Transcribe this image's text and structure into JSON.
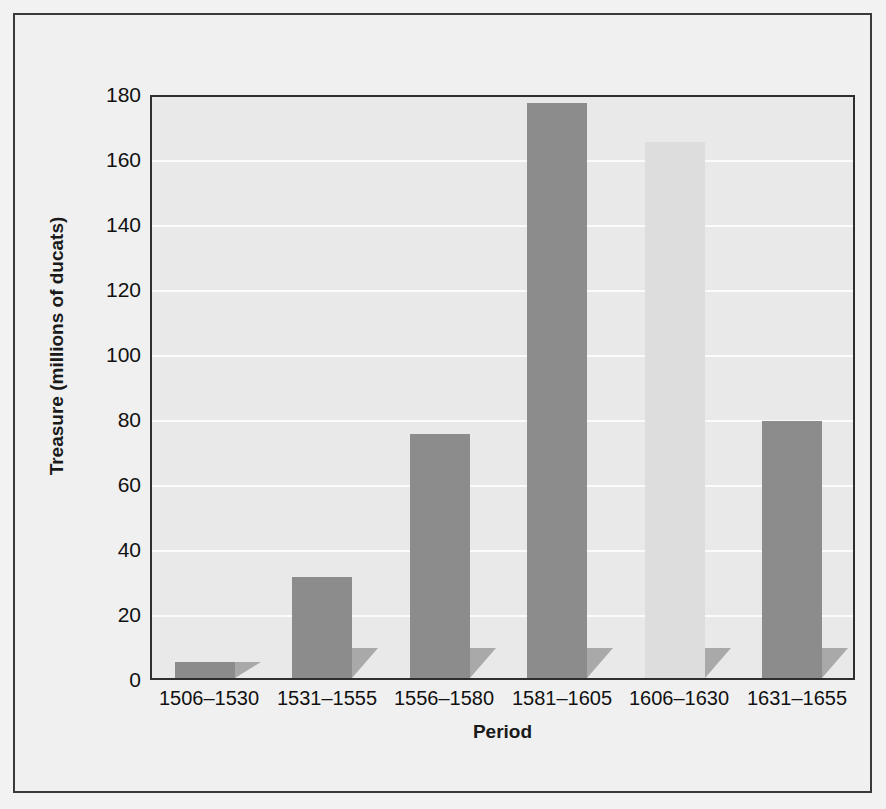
{
  "chart_data": {
    "type": "bar",
    "title": "",
    "xlabel": "Period",
    "ylabel": "Treasure (millions of ducats)",
    "categories": [
      "1506–1530",
      "1531–1555",
      "1556–1580",
      "1581–1605",
      "1606–1630",
      "1631–1655"
    ],
    "values": [
      5,
      31,
      75,
      177,
      165,
      79
    ],
    "ylim": [
      0,
      180
    ],
    "yticks": [
      0,
      20,
      40,
      60,
      80,
      100,
      120,
      140,
      160,
      180
    ],
    "ytick_labels": [
      "0",
      "20",
      "40",
      "60",
      "80",
      "100",
      "120",
      "140",
      "160",
      "180"
    ],
    "grid": true,
    "legend": "none",
    "bar_colors": [
      "#8c8c8c",
      "#8c8c8c",
      "#8c8c8c",
      "#8c8c8c",
      "#dddddd",
      "#8c8c8c"
    ],
    "plot_background": "#e9e9e9",
    "gridline_color": "#fbfbfb",
    "axis_color": "#2f2f2f",
    "figure_background": "#f0f0f0"
  }
}
